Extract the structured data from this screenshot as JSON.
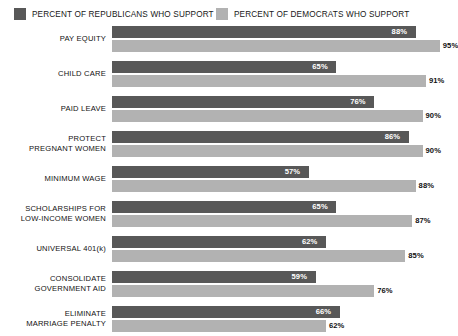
{
  "legend": {
    "republican": {
      "label": "PERCENT OF REPUBLICANS WHO SUPPORT",
      "color": "#585858"
    },
    "democrat": {
      "label": "PERCENT OF DEMOCRATS WHO SUPPORT",
      "color": "#b2b2b2"
    }
  },
  "chart_data": {
    "type": "bar",
    "orientation": "horizontal",
    "title": "",
    "xlabel": "",
    "ylabel": "",
    "xlim": [
      0,
      100
    ],
    "grid": false,
    "legend_position": "top",
    "categories": [
      "PAY EQUITY",
      "CHILD CARE",
      "PAID LEAVE",
      "PROTECT PREGNANT WOMEN",
      "MINIMUM WAGE",
      "SCHOLARSHIPS FOR LOW-INCOME WOMEN",
      "UNIVERSAL 401(k)",
      "CONSOLIDATE GOVERNMENT AID",
      "ELIMINATE MARRIAGE PENALTY"
    ],
    "category_lines": [
      [
        "PAY EQUITY"
      ],
      [
        "CHILD CARE"
      ],
      [
        "PAID LEAVE"
      ],
      [
        "PROTECT",
        "PREGNANT WOMEN"
      ],
      [
        "MINIMUM WAGE"
      ],
      [
        "SCHOLARSHIPS FOR",
        "LOW-INCOME WOMEN"
      ],
      [
        "UNIVERSAL 401(k)"
      ],
      [
        "CONSOLIDATE",
        "GOVERNMENT AID"
      ],
      [
        "ELIMINATE",
        "MARRIAGE PENALTY"
      ]
    ],
    "series": [
      {
        "name": "PERCENT OF REPUBLICANS WHO SUPPORT",
        "color": "#585858",
        "values": [
          88,
          65,
          76,
          86,
          57,
          65,
          62,
          59,
          66
        ],
        "labels": [
          "88%",
          "65%",
          "76%",
          "86%",
          "57%",
          "65%",
          "62%",
          "59%",
          "66%"
        ]
      },
      {
        "name": "PERCENT OF DEMOCRATS WHO SUPPORT",
        "color": "#b2b2b2",
        "values": [
          95,
          91,
          90,
          90,
          88,
          87,
          85,
          76,
          62
        ],
        "labels": [
          "95%",
          "91%",
          "90%",
          "90%",
          "88%",
          "87%",
          "85%",
          "76%",
          "62%"
        ]
      }
    ]
  }
}
